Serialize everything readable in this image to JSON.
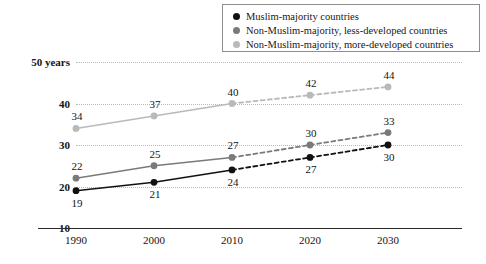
{
  "legend": {
    "items": [
      {
        "label": "Muslim-majority countries",
        "color": "#111111",
        "icon": "circle-marker-icon"
      },
      {
        "label": "Non-Muslim-majority, less-developed countries",
        "color": "#7a7a7a",
        "icon": "circle-marker-icon"
      },
      {
        "label": "Non-Muslim-majority, more-developed countries",
        "color": "#b9b9b9",
        "icon": "circle-marker-icon"
      }
    ]
  },
  "chart_data": {
    "type": "line",
    "title": "",
    "subtitle": "",
    "xlabel": "",
    "ylabel": "",
    "x": [
      1990,
      2000,
      2010,
      2020,
      2030
    ],
    "categories": [
      "1990",
      "2000",
      "2010",
      "2020",
      "2030"
    ],
    "ylim": [
      10,
      50
    ],
    "yticks": [
      10,
      20,
      30,
      40,
      50
    ],
    "ytick_labels": [
      "10",
      "20",
      "30",
      "40",
      "50 years"
    ],
    "grid": true,
    "legend_position": "top-right",
    "projection_starts_at": 2010,
    "series": [
      {
        "name": "Muslim-majority countries",
        "color": "#111111",
        "values": [
          19,
          21,
          24,
          27,
          30
        ],
        "labels": [
          "19",
          "21",
          "24",
          "27",
          "30"
        ],
        "label_positions": [
          "below",
          "below",
          "below",
          "below",
          "below"
        ]
      },
      {
        "name": "Non-Muslim-majority, less-developed countries",
        "color": "#7a7a7a",
        "values": [
          22,
          25,
          27,
          30,
          33
        ],
        "labels": [
          "22",
          "25",
          "27",
          "30",
          "33"
        ],
        "label_positions": [
          "above",
          "above",
          "above",
          "above",
          "above"
        ]
      },
      {
        "name": "Non-Muslim-majority, more-developed countries",
        "color": "#b9b9b9",
        "values": [
          34,
          37,
          40,
          42,
          44
        ],
        "labels": [
          "34",
          "37",
          "40",
          "42",
          "44"
        ],
        "label_positions": [
          "above",
          "above",
          "above",
          "above",
          "above"
        ]
      }
    ]
  }
}
